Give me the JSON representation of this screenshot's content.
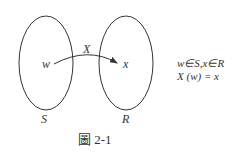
{
  "diagram": {
    "sets": [
      {
        "name": "S",
        "element": "w"
      },
      {
        "name": "R",
        "element": "x"
      }
    ],
    "mapping_label": "X",
    "element_w": "w",
    "element_x": "x",
    "set_S_label": "S",
    "set_R_label": "R",
    "notes": [
      "w∈S,x∈R",
      "X (w) = x"
    ],
    "caption": "圖 2-1",
    "stroke_color": "#333333"
  }
}
